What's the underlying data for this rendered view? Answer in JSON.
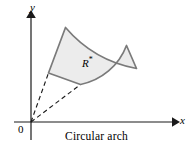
{
  "figure": {
    "caption": "Circular arch",
    "region_label": "R",
    "region_label_superscript": "*",
    "origin_label": "0",
    "axes": {
      "x_label": "x",
      "y_label": "y"
    },
    "colors": {
      "region_fill": "#ececec",
      "region_stroke": "#7a7a7a",
      "axis": "#1a1a1a",
      "dashed": "#1a1a1a",
      "background": "#ffffff"
    },
    "geometry": {
      "type": "annular-sector",
      "origin": [
        31,
        122
      ],
      "inner_radius": 62,
      "outer_radius": 123,
      "start_angle_deg": 39,
      "end_angle_deg": 74,
      "inner_corner_start": [
        79,
        83
      ],
      "inner_corner_end": [
        48,
        74
      ],
      "outer_corner_start": [
        126,
        45
      ],
      "outer_corner_end": [
        65,
        28
      ],
      "dashed_rays": 2
    },
    "axis_extents": {
      "x_axis": [
        14,
        122,
        176,
        122
      ],
      "y_axis": [
        31,
        140,
        31,
        14
      ]
    }
  }
}
